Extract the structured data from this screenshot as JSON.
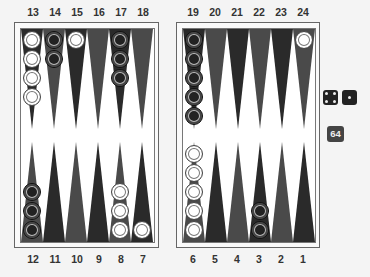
{
  "top_labels": [
    "13",
    "14",
    "15",
    "16",
    "17",
    "18",
    "19",
    "20",
    "21",
    "22",
    "23",
    "24"
  ],
  "bottom_labels": [
    "12",
    "11",
    "10",
    "9",
    "8",
    "7",
    "6",
    "5",
    "4",
    "3",
    "2",
    "1"
  ],
  "colors": {
    "point_dark": "#1e1e1e",
    "point_gray": "#555555",
    "checker_white": "#ffffff",
    "checker_black": "#222222",
    "board_border": "#666666"
  },
  "checkers": {
    "13": {
      "color": "white",
      "count": 4
    },
    "14": {
      "color": "black",
      "count": 2
    },
    "15": {
      "color": "white",
      "count": 1
    },
    "17": {
      "color": "black",
      "count": 3
    },
    "19": {
      "color": "black",
      "count": 5
    },
    "24": {
      "color": "white",
      "count": 1
    },
    "12": {
      "color": "black",
      "count": 3
    },
    "8": {
      "color": "white",
      "count": 3
    },
    "7": {
      "color": "white",
      "count": 1
    },
    "6": {
      "color": "white",
      "count": 5
    },
    "3": {
      "color": "black",
      "count": 2
    }
  },
  "dice": [
    4,
    1
  ],
  "cube": {
    "value": "64"
  },
  "caption": {
    "text": ""
  }
}
